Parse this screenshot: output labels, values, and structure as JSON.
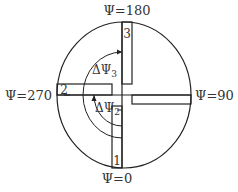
{
  "diagram": {
    "type": "orientation-diagram",
    "stroke_color": "#222222",
    "text_color": "#333333",
    "labels": {
      "top": "Ψ=180",
      "bottom": "Ψ=0",
      "left": "Ψ=270",
      "right": "Ψ=90"
    },
    "panels": [
      {
        "id": "1",
        "label": "1",
        "position": "bottom"
      },
      {
        "id": "2",
        "label": "2",
        "position": "left"
      },
      {
        "id": "3",
        "label": "3",
        "position": "top"
      }
    ],
    "arcs": [
      {
        "label_base": "ΔΨ",
        "label_sub": "2"
      },
      {
        "label_base": "ΔΨ",
        "label_sub": "3"
      }
    ]
  }
}
